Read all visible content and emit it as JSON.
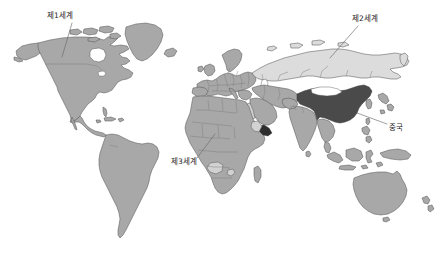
{
  "figure": {
    "type": "world-map",
    "title": "",
    "background_color": "#ffffff",
    "width": 437,
    "height": 263
  },
  "palette": {
    "land_default": "#a8a8a8",
    "land_second_world": "#dcdcdc",
    "land_china": "#4a4a4a",
    "land_highlight_light": "#d2d2d2",
    "outline": "#5a5a5a",
    "border_internal": "#7a7a7a",
    "leader_line": "#6b6b6b",
    "label_text": "#1d1d1d",
    "ocean": "#ffffff"
  },
  "labels": {
    "first_world": "제1세계",
    "second_world": "제2세계",
    "third_world": "제3세계",
    "china": "중국"
  },
  "annotations": [
    {
      "id": "first-world",
      "text": "제1세계",
      "points_to": "north-america",
      "label_x": 47,
      "label_y": 12,
      "leader_from_x": 72,
      "leader_from_y": 23,
      "leader_to_x": 62,
      "leader_to_y": 57
    },
    {
      "id": "second-world",
      "text": "제2세계",
      "points_to": "russia",
      "label_x": 352,
      "label_y": 15,
      "leader_from_x": 358,
      "leader_from_y": 26,
      "leader_to_x": 330,
      "leader_to_y": 58
    },
    {
      "id": "third-world",
      "text": "제3세계",
      "points_to": "africa",
      "label_x": 171,
      "label_y": 158,
      "leader_from_x": 197,
      "leader_from_y": 158,
      "leader_to_x": 215,
      "leader_to_y": 134
    },
    {
      "id": "china",
      "text": "중국",
      "points_to": "china",
      "label_x": 389,
      "label_y": 124,
      "leader_from_x": 387,
      "leader_from_y": 124,
      "leader_to_x": 357,
      "leader_to_y": 113
    }
  ],
  "regions": [
    {
      "id": "north-america",
      "name": "North America",
      "shade": "land_default"
    },
    {
      "id": "greenland",
      "name": "Greenland",
      "shade": "land_default"
    },
    {
      "id": "south-america",
      "name": "South America",
      "shade": "land_default"
    },
    {
      "id": "europe",
      "name": "Europe",
      "shade": "land_default"
    },
    {
      "id": "africa",
      "name": "Africa",
      "shade": "land_default"
    },
    {
      "id": "russia",
      "name": "Russia / USSR",
      "shade": "land_second_world"
    },
    {
      "id": "middle-east",
      "name": "Middle East / South Asia",
      "shade": "land_default"
    },
    {
      "id": "china",
      "name": "China",
      "shade": "land_china"
    },
    {
      "id": "southeast-asia",
      "name": "Southeast Asia",
      "shade": "land_default"
    },
    {
      "id": "australia",
      "name": "Australia",
      "shade": "land_default"
    },
    {
      "id": "new-zealand",
      "name": "New Zealand",
      "shade": "land_default"
    }
  ]
}
